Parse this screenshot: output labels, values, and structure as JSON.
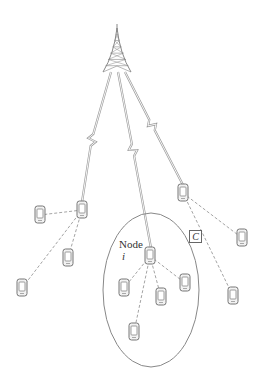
{
  "diagram": {
    "type": "wireless-network-clustering",
    "colors": {
      "line": "#9a9a9a",
      "device_stroke": "#777777",
      "device_fill": "#f2f2f2",
      "ellipse": "#888888",
      "tower": "#888888"
    },
    "tower": {
      "icon": "cell-tower-icon",
      "apex": [
        117,
        24
      ],
      "base_left": [
        103,
        72
      ],
      "base_right": [
        131,
        72
      ]
    },
    "labels": {
      "node": "Node",
      "node_index": "i",
      "cluster": "C"
    },
    "clusters": [
      {
        "id": "left",
        "head": [
          82,
          210
        ],
        "members": [
          [
            40,
            215
          ],
          [
            68,
            258
          ],
          [
            22,
            288
          ]
        ]
      },
      {
        "id": "center",
        "head": [
          150,
          256
        ],
        "members": [
          [
            124,
            288
          ],
          [
            185,
            283
          ],
          [
            161,
            297
          ],
          [
            134,
            332
          ]
        ],
        "enclosed": true
      },
      {
        "id": "right",
        "head": [
          183,
          193
        ],
        "members": [
          [
            242,
            238
          ],
          [
            233,
            296
          ]
        ]
      }
    ],
    "uplinks": [
      {
        "from": [
          111,
          72
        ],
        "to": [
          82,
          202
        ],
        "bolt": [
          92,
          140
        ]
      },
      {
        "from": [
          118,
          72
        ],
        "to": [
          151,
          248
        ],
        "bolt": [
          133,
          150
        ]
      },
      {
        "from": [
          125,
          72
        ],
        "to": [
          183,
          185
        ],
        "bolt": [
          152,
          125
        ]
      }
    ],
    "ellipse": {
      "cx": 151,
      "cy": 290,
      "rx": 48,
      "ry": 77
    }
  }
}
